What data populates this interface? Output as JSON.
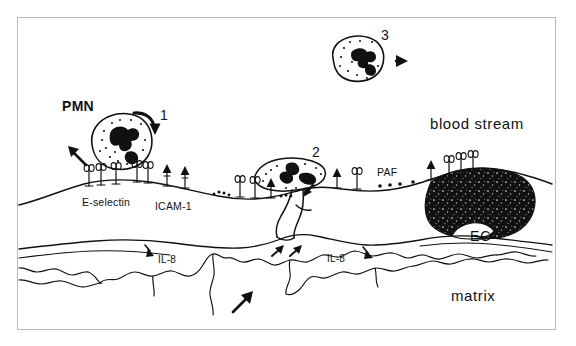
{
  "figure": {
    "background_color": "#ffffff",
    "ink_color": "#111111",
    "border_color": "#b9b9b9"
  },
  "labels": {
    "pmn": "PMN",
    "blood_stream": "blood stream",
    "matrix": "matrix",
    "ec": "EC",
    "e_selectin": "E-selectin",
    "icam1": "ICAM-1",
    "paf": "PAF",
    "il8_left": "IL-8",
    "il8_right": "IL-8"
  },
  "steps": {
    "one": "1",
    "two": "2",
    "three": "3"
  },
  "cells": [
    {
      "name": "pmn-rolling-cell",
      "step": "1",
      "state": "rounded, rolling on endothelium"
    },
    {
      "name": "pmn-transmigrating-cell",
      "step": "2",
      "state": "flattened, spreading and diapedesis"
    },
    {
      "name": "pmn-free-flowing-cell",
      "step": "3",
      "state": "free in blood stream"
    }
  ],
  "receptors": {
    "e_selectin_count": 8,
    "icam1_count": 3,
    "paf_dot_count": 4
  },
  "arrow_names": [
    "arrow-step1-curved",
    "arrow-pmn-up-left",
    "arrow-cell3-right",
    "arrow-cell2-down",
    "arrow-matrix-up-right",
    "arrow-il8-left-down",
    "arrow-il8-right-down",
    "arrow-matrix-pair-a",
    "arrow-matrix-pair-b"
  ]
}
